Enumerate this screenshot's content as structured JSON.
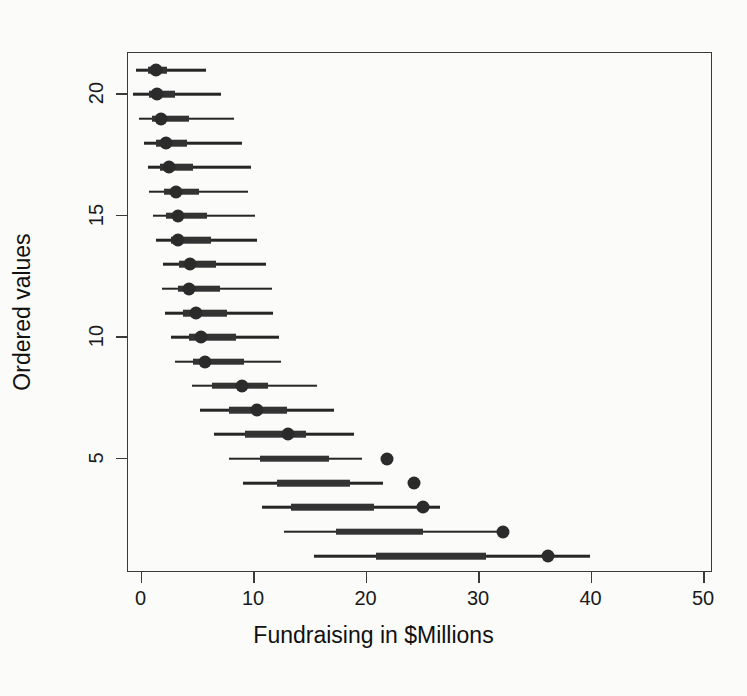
{
  "chart_data": {
    "type": "scatter",
    "title": "",
    "subtitle": "",
    "xlabel": "Fundraising in $Millions",
    "ylabel": "Ordered values",
    "xlim": [
      -1.2,
      50.8
    ],
    "ylim": [
      0.3,
      21.7
    ],
    "xticks": [
      0,
      10,
      20,
      30,
      40,
      50
    ],
    "xticklabels": [
      "0",
      "10",
      "20",
      "30",
      "40",
      "50"
    ],
    "yticks": [
      5,
      10,
      15,
      20
    ],
    "yticklabels": [
      "5",
      "10",
      "15",
      "20"
    ],
    "grid": false,
    "legend": null,
    "annotations": [],
    "point_color": "#2b2b2b",
    "line_color": "#262626",
    "inner_color": "#333333",
    "axis_color": "#3b3b3b",
    "background": "#fbfbfa",
    "series_note": "Dot-and-interval (caterpillar) plot: point estimate with thick inner interval and thin outer interval per ordered value.",
    "columns": [
      "ordered_value",
      "outer_low",
      "inner_low",
      "point",
      "inner_high",
      "outer_high"
    ],
    "rows": [
      {
        "ordered_value": 21,
        "outer_low": -0.5,
        "inner_low": 0.6,
        "point": 1.3,
        "inner_high": 2.3,
        "outer_high": 5.7
      },
      {
        "ordered_value": 20,
        "outer_low": -0.8,
        "inner_low": 0.7,
        "point": 1.4,
        "inner_high": 3.0,
        "outer_high": 7.1
      },
      {
        "ordered_value": 19,
        "outer_low": -0.2,
        "inner_low": 0.9,
        "point": 1.7,
        "inner_high": 4.2,
        "outer_high": 8.2
      },
      {
        "ordered_value": 18,
        "outer_low": 0.2,
        "inner_low": 1.3,
        "point": 2.2,
        "inner_high": 4.0,
        "outer_high": 8.9
      },
      {
        "ordered_value": 17,
        "outer_low": 0.6,
        "inner_low": 1.6,
        "point": 2.4,
        "inner_high": 4.6,
        "outer_high": 9.7
      },
      {
        "ordered_value": 16,
        "outer_low": 0.7,
        "inner_low": 2.0,
        "point": 3.1,
        "inner_high": 5.1,
        "outer_high": 9.5
      },
      {
        "ordered_value": 15,
        "outer_low": 1.0,
        "inner_low": 2.2,
        "point": 3.2,
        "inner_high": 5.8,
        "outer_high": 10.1
      },
      {
        "ordered_value": 14,
        "outer_low": 1.3,
        "inner_low": 2.6,
        "point": 3.2,
        "inner_high": 6.2,
        "outer_high": 10.3
      },
      {
        "ordered_value": 13,
        "outer_low": 1.9,
        "inner_low": 3.3,
        "point": 4.3,
        "inner_high": 6.6,
        "outer_high": 11.1
      },
      {
        "ordered_value": 12,
        "outer_low": 1.8,
        "inner_low": 3.2,
        "point": 4.2,
        "inner_high": 7.0,
        "outer_high": 11.6
      },
      {
        "ordered_value": 11,
        "outer_low": 2.1,
        "inner_low": 3.7,
        "point": 4.8,
        "inner_high": 7.6,
        "outer_high": 11.7
      },
      {
        "ordered_value": 10,
        "outer_low": 2.6,
        "inner_low": 4.2,
        "point": 5.3,
        "inner_high": 8.4,
        "outer_high": 12.2
      },
      {
        "ordered_value": 9,
        "outer_low": 3.0,
        "inner_low": 4.6,
        "point": 5.6,
        "inner_high": 9.1,
        "outer_high": 12.4
      },
      {
        "ordered_value": 8,
        "outer_low": 4.5,
        "inner_low": 6.3,
        "point": 8.9,
        "inner_high": 11.2,
        "outer_high": 15.6
      },
      {
        "ordered_value": 7,
        "outer_low": 5.2,
        "inner_low": 7.8,
        "point": 10.3,
        "inner_high": 12.9,
        "outer_high": 17.1
      },
      {
        "ordered_value": 6,
        "outer_low": 6.4,
        "inner_low": 9.2,
        "point": 13.0,
        "inner_high": 14.6,
        "outer_high": 18.9
      },
      {
        "ordered_value": 5,
        "outer_low": 7.8,
        "inner_low": 10.5,
        "point": 21.8,
        "inner_high": 16.7,
        "outer_high": 19.6
      },
      {
        "ordered_value": 4,
        "outer_low": 9.0,
        "inner_low": 12.0,
        "point": 24.2,
        "inner_high": 18.5,
        "outer_high": 21.5
      },
      {
        "ordered_value": 3,
        "outer_low": 10.7,
        "inner_low": 13.3,
        "point": 25.0,
        "inner_high": 20.7,
        "outer_high": 26.5
      },
      {
        "ordered_value": 2,
        "outer_low": 12.7,
        "inner_low": 17.3,
        "point": 32.1,
        "inner_high": 25.0,
        "outer_high": 32.2
      },
      {
        "ordered_value": 1,
        "outer_low": 15.3,
        "inner_low": 20.8,
        "point": 36.1,
        "inner_high": 30.6,
        "outer_high": 39.9
      }
    ]
  }
}
